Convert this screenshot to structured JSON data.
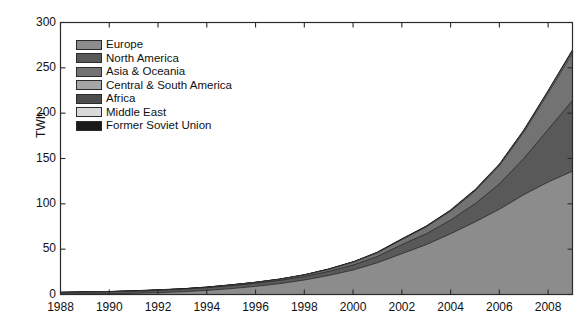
{
  "chart_data": {
    "type": "area",
    "stacked": true,
    "title": "",
    "xlabel": "",
    "ylabel": "TWh",
    "xlim": [
      1988,
      2009
    ],
    "ylim": [
      0,
      300
    ],
    "ytick_labels": [
      "0",
      "50",
      "100",
      "150",
      "200",
      "250",
      "300"
    ],
    "ytick_values": [
      0,
      50,
      100,
      150,
      200,
      250,
      300
    ],
    "xtick_labels": [
      "1988",
      "1990",
      "1992",
      "1994",
      "1996",
      "1998",
      "2000",
      "2002",
      "2004",
      "2006",
      "2008"
    ],
    "xtick_values": [
      1988,
      1990,
      1992,
      1994,
      1996,
      1998,
      2000,
      2002,
      2004,
      2006,
      2008
    ],
    "grid": false,
    "legend_position": "upper-left",
    "x": [
      1988,
      1989,
      1990,
      1991,
      1992,
      1993,
      1994,
      1995,
      1996,
      1997,
      1998,
      1999,
      2000,
      2001,
      2002,
      2003,
      2004,
      2005,
      2006,
      2007,
      2008,
      2009
    ],
    "series": [
      {
        "name": "Europe",
        "color": "#8c8c8c",
        "values": [
          0.4,
          0.6,
          0.8,
          1.3,
          2.0,
          3.0,
          4.5,
          6.5,
          9.0,
          12.0,
          16.0,
          21.0,
          27.0,
          35.0,
          45.0,
          55.0,
          67.0,
          80.0,
          94.0,
          110.0,
          124.0,
          136.0
        ]
      },
      {
        "name": "North America",
        "color": "#595959",
        "values": [
          1.8,
          2.0,
          2.2,
          2.4,
          2.6,
          2.8,
          3.0,
          3.2,
          3.4,
          3.6,
          3.8,
          4.5,
          5.5,
          7.0,
          10.0,
          12.0,
          15.0,
          20.0,
          28.0,
          40.0,
          58.0,
          78.0
        ]
      },
      {
        "name": "Asia & Oceania",
        "color": "#737373",
        "values": [
          0.1,
          0.1,
          0.2,
          0.2,
          0.3,
          0.4,
          0.5,
          0.7,
          0.9,
          1.2,
          1.6,
          2.2,
          3.0,
          4.0,
          5.5,
          7.5,
          10.0,
          14.0,
          20.0,
          29.0,
          40.0,
          52.0
        ]
      },
      {
        "name": "Central & South America",
        "color": "#a6a6a6",
        "values": [
          0.0,
          0.0,
          0.0,
          0.0,
          0.0,
          0.0,
          0.0,
          0.1,
          0.1,
          0.1,
          0.2,
          0.2,
          0.3,
          0.3,
          0.4,
          0.5,
          0.6,
          0.8,
          1.0,
          1.3,
          1.8,
          2.4
        ]
      },
      {
        "name": "Africa",
        "color": "#4d4d4d",
        "values": [
          0.0,
          0.0,
          0.0,
          0.0,
          0.0,
          0.0,
          0.0,
          0.0,
          0.0,
          0.0,
          0.0,
          0.0,
          0.0,
          0.1,
          0.1,
          0.1,
          0.1,
          0.2,
          0.2,
          0.3,
          0.4,
          0.5
        ]
      },
      {
        "name": "Middle East",
        "color": "#d9d9d9",
        "values": [
          0.0,
          0.0,
          0.0,
          0.0,
          0.0,
          0.0,
          0.0,
          0.0,
          0.0,
          0.0,
          0.0,
          0.0,
          0.0,
          0.0,
          0.0,
          0.0,
          0.1,
          0.1,
          0.1,
          0.1,
          0.2,
          0.2
        ]
      },
      {
        "name": "Former Soviet Union",
        "color": "#1a1a1a",
        "values": [
          0.0,
          0.0,
          0.0,
          0.0,
          0.0,
          0.0,
          0.0,
          0.0,
          0.0,
          0.0,
          0.0,
          0.0,
          0.0,
          0.0,
          0.0,
          0.0,
          0.0,
          0.0,
          0.0,
          0.0,
          0.0,
          0.1
        ]
      }
    ]
  },
  "axes": {
    "ylabel": "TWh"
  },
  "legend": {
    "items": [
      {
        "label": "Europe"
      },
      {
        "label": "North America"
      },
      {
        "label": "Asia & Oceania"
      },
      {
        "label": "Central & South America"
      },
      {
        "label": "Africa"
      },
      {
        "label": "Middle East"
      },
      {
        "label": "Former Soviet Union"
      }
    ]
  },
  "style": {
    "axis_color": "#2b2b2b",
    "text_color": "#111111",
    "background": "#ffffff"
  }
}
